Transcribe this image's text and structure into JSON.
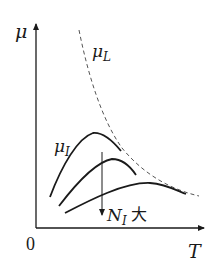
{
  "diagram": {
    "axes": {
      "y_label": "μ",
      "x_label": "T",
      "origin_label": "0"
    },
    "curves": {
      "lattice": {
        "label_main": "μ",
        "label_sub": "L",
        "style": "dashed"
      },
      "impurity": {
        "label_main": "μ",
        "label_sub": "I",
        "style": "solid",
        "count": 3
      }
    },
    "arrow_annotation": {
      "label_main": "N",
      "label_sub": "I",
      "label_suffix": "大"
    },
    "colors": {
      "line": "#1a1a1a",
      "dashed": "#555555",
      "background": "#ffffff"
    }
  }
}
